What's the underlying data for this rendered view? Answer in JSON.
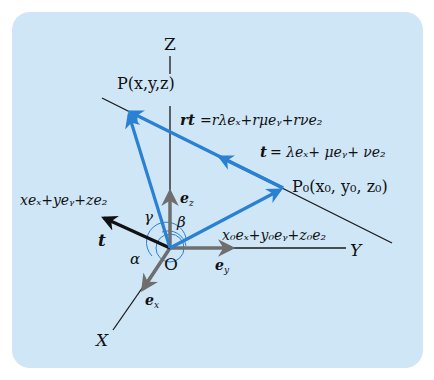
{
  "diagram": {
    "axes": {
      "x_label": "X",
      "y_label": "Y",
      "z_label": "Z",
      "origin_label": "O"
    },
    "unit_vectors": {
      "ex": "e",
      "ex_sub": "x",
      "ey": "e",
      "ey_sub": "y",
      "ez": "e",
      "ez_sub": "z"
    },
    "points": {
      "P": "P(x,y,z)",
      "P0": "P₀(x₀, y₀, z₀)"
    },
    "labels": {
      "rt": "rt",
      "rt_eq": "=rλeₓ+rμeᵧ+rνe₂",
      "t": "t",
      "t_eq": "= λeₓ+ μeᵧ+ νe₂",
      "op_vec": "xeₓ+yeᵧ+ze₂",
      "op0_vec": "x₀eₓ+y₀eᵧ+z₀e₂",
      "t_vec": "t"
    },
    "angles": {
      "alpha": "α",
      "beta": "β",
      "gamma": "γ"
    },
    "colors": {
      "background_panel": "#cfe6f7",
      "vector_blue": "#2a80d2",
      "unit_vector_gray": "#6e6e6e",
      "axis_black": "#1a1a1a",
      "t_vector": "#111111"
    }
  }
}
